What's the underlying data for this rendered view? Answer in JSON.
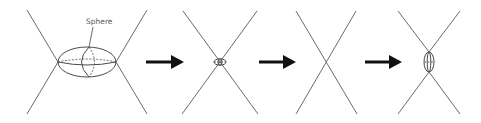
{
  "diagram": {
    "label": "Sphere",
    "stages": [
      {
        "name": "stage-1",
        "description": "Two crossing lines with a large ellipsoid (sphere) at the intersection"
      },
      {
        "name": "stage-2",
        "description": "Two crossing lines with a small ellipsoid at the intersection"
      },
      {
        "name": "stage-3",
        "description": "Two crossing lines with no ellipsoid"
      },
      {
        "name": "stage-4",
        "description": "Two crossing lines with a small vertically elongated ellipsoid at the intersection"
      }
    ],
    "arrows": 3,
    "colors": {
      "line": "#6b6b6b",
      "ellipse": "#4a4a4a",
      "arrow": "#111111",
      "label": "#555555"
    }
  }
}
